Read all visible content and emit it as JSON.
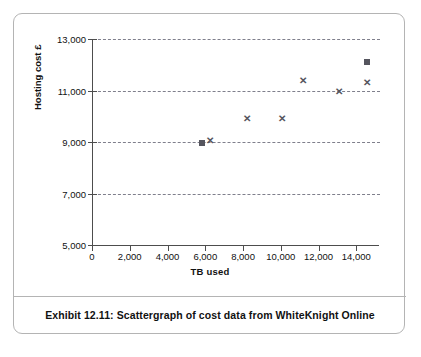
{
  "figure": {
    "caption": "Exhibit 12.11:  Scattergraph of cost data from WhiteKnight Online",
    "border_color": "#b4b4b4",
    "marker_color": "#55555e"
  },
  "chart_data": {
    "type": "scatter",
    "title": "",
    "xlabel": "TB used",
    "ylabel": "Hosting cost £",
    "xlim": [
      0,
      15200
    ],
    "ylim": [
      5000,
      13000
    ],
    "xticks": [
      0,
      2000,
      4000,
      6000,
      8000,
      10000,
      12000,
      14000
    ],
    "xtick_labels": [
      "0",
      "2,000",
      "4,000",
      "6,000",
      "8,000",
      "10,000",
      "12,000",
      "14,000"
    ],
    "yticks": [
      5000,
      7000,
      9000,
      11000,
      13000
    ],
    "ytick_labels": [
      "5,000",
      "7,000",
      "9,000",
      "11,000",
      "13,000"
    ],
    "grid": "horizontal-dashed",
    "gridlines_y": [
      7000,
      9000,
      11000,
      13000
    ],
    "legend": "none",
    "series": [
      {
        "name": "squares",
        "marker": "square",
        "points": [
          {
            "x": 5850,
            "y": 8960
          },
          {
            "x": 14550,
            "y": 12100
          }
        ]
      },
      {
        "name": "crosses",
        "marker": "x",
        "points": [
          {
            "x": 6230,
            "y": 9090
          },
          {
            "x": 8220,
            "y": 9940
          },
          {
            "x": 10060,
            "y": 9950
          },
          {
            "x": 11200,
            "y": 11410
          },
          {
            "x": 13060,
            "y": 10970
          },
          {
            "x": 14560,
            "y": 11330
          }
        ]
      }
    ]
  }
}
